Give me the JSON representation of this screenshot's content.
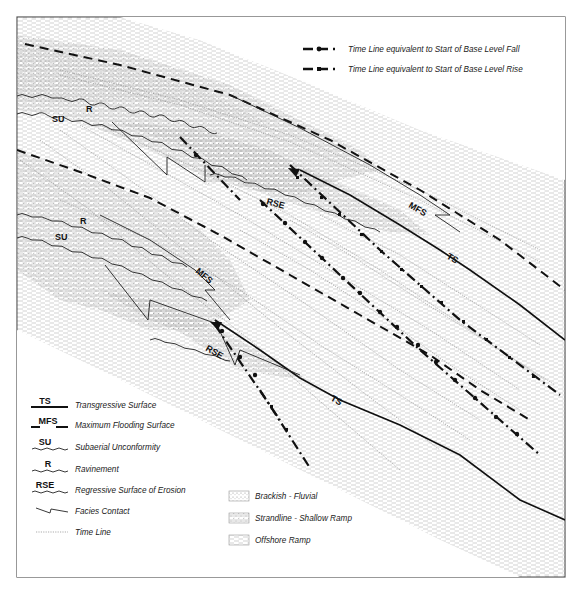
{
  "diagram": {
    "colors": {
      "line": "#111111",
      "frame": "#555555",
      "offshore_fill_dash": "#b8b8b8",
      "strandline_dot": "#9a9a9a",
      "background": "#ffffff"
    },
    "surface_tags": {
      "upper_r": "R",
      "upper_su": "SU",
      "upper_rse": "RSE",
      "upper_mfs": "MFS",
      "upper_ts": "TS",
      "lower_r": "R",
      "lower_su": "SU",
      "lower_rse": "RSE",
      "lower_mfs": "MFS",
      "lower_ts": "TS"
    }
  },
  "legend_top": {
    "items": [
      {
        "symbol": "dash-dot-circle",
        "label": "Time Line equivalent to Start of Base Level Fall"
      },
      {
        "symbol": "dash-dot-square",
        "label": "Time Line equivalent to Start of Base Level Rise"
      }
    ]
  },
  "legend_surfaces": {
    "items": [
      {
        "tag": "TS",
        "symbol": "solid-line",
        "label": "Transgressive Surface"
      },
      {
        "tag": "MFS",
        "symbol": "dashed-line",
        "label": "Maximum Flooding Surface"
      },
      {
        "tag": "SU",
        "symbol": "wavy-line",
        "label": "Subaerial Unconformity"
      },
      {
        "tag": "R",
        "symbol": "wavy-line",
        "label": "Ravinement"
      },
      {
        "tag": "RSE",
        "symbol": "wavy-line",
        "label": "Regressive Surface of Erosion"
      },
      {
        "tag": "",
        "symbol": "facies-contact",
        "label": "Facies Contact"
      },
      {
        "tag": "",
        "symbol": "dotted-line",
        "label": "Time Line"
      }
    ]
  },
  "legend_facies": {
    "items": [
      {
        "pattern": "brackish-fluvial",
        "label": "Brackish - Fluvial"
      },
      {
        "pattern": "strandline-shallow-ramp",
        "label": "Strandline - Shallow Ramp"
      },
      {
        "pattern": "offshore-ramp",
        "label": "Offshore Ramp"
      }
    ]
  }
}
